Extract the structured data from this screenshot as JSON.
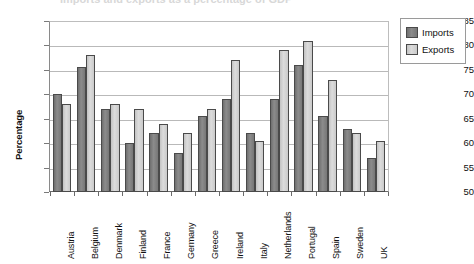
{
  "title_fragment": "Imports and exports as a percentage of GDP",
  "axis": {
    "ylabel": "Percentage",
    "yticks": [
      50,
      55,
      60,
      65,
      70,
      75,
      80,
      85
    ],
    "ymin": 50,
    "ymax": 85
  },
  "legend": {
    "position": "right",
    "entries": [
      {
        "label": "Imports",
        "color": "#7b7b7b"
      },
      {
        "label": "Exports",
        "color": "#cfcfcf"
      }
    ]
  },
  "colors": {
    "imports": "#7b7b7b",
    "exports": "#cfcfcf",
    "bar_border": "#4a4a4a",
    "gridline": "#b9b9b9",
    "axis": "#6a6a6a",
    "text": "#111111"
  },
  "chart_data": {
    "type": "bar",
    "title": "Imports and exports as a percentage of GDP",
    "xlabel": "",
    "ylabel": "Percentage",
    "ylim": [
      50,
      85
    ],
    "ytick_step": 5,
    "grid": true,
    "legend_position": "right",
    "categories": [
      "Austria",
      "Belgium",
      "Denmark",
      "Finland",
      "France",
      "Germany",
      "Greece",
      "Ireland",
      "Italy",
      "Netherlands",
      "Portugal",
      "Spain",
      "Sweden",
      "UK"
    ],
    "series": [
      {
        "name": "Imports",
        "color": "#7b7b7b",
        "values": [
          70,
          75.5,
          67,
          60,
          62,
          58,
          65.5,
          69,
          62,
          69,
          76,
          65.5,
          63,
          57
        ]
      },
      {
        "name": "Exports",
        "color": "#cfcfcf",
        "values": [
          68,
          78,
          68,
          67,
          64,
          62,
          67,
          77,
          60.5,
          79,
          81,
          73,
          62,
          60.5
        ]
      }
    ]
  }
}
